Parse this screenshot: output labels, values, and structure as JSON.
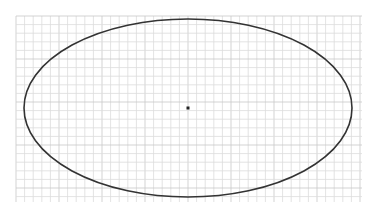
{
  "canvas": {
    "width": 375,
    "height": 219,
    "background": "#ffffff"
  },
  "grid": {
    "x0": 16,
    "y0": 16,
    "x1": 362,
    "y1": 202,
    "spacing": 8.6,
    "color": "#dcdcdc",
    "major_every": 5,
    "major_color": "#c8c8c8"
  },
  "ellipse": {
    "cx": 188,
    "cy": 108,
    "rx": 164,
    "ry": 89,
    "stroke": "#333333",
    "stroke_width": 1.6
  },
  "center_point": {
    "x": 188,
    "y": 108,
    "size": 3,
    "color": "#222222"
  }
}
